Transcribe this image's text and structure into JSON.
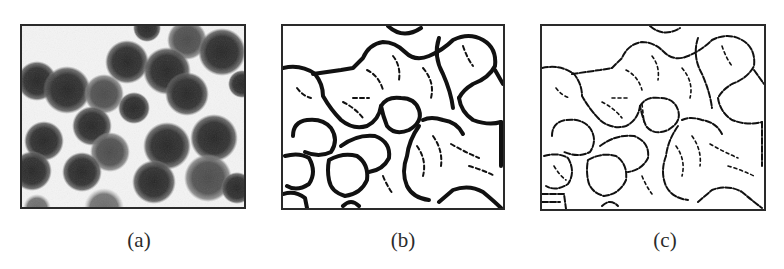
{
  "figure": {
    "panels": [
      {
        "id": "a",
        "label": "(a)",
        "description": "grayscale micrograph of cells"
      },
      {
        "id": "b",
        "label": "(b)",
        "description": "thick edge detection result"
      },
      {
        "id": "c",
        "label": "(c)",
        "description": "thin edge detection result"
      }
    ]
  }
}
